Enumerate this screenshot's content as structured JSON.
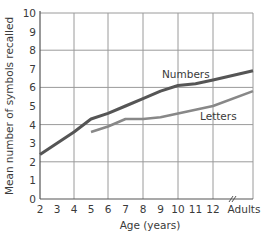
{
  "chart_data": {
    "type": "line",
    "title": "",
    "xlabel": "Age (years)",
    "ylabel": "Mean number of symbols recalled",
    "x_tick_labels": [
      "2",
      "3",
      "4",
      "5",
      "6",
      "7",
      "8",
      "9",
      "10",
      "11",
      "12",
      "Adults"
    ],
    "y_tick_labels": [
      "0",
      "1",
      "2",
      "3",
      "4",
      "5",
      "6",
      "7",
      "8",
      "9",
      "10"
    ],
    "ylim": [
      0,
      10
    ],
    "grid": true,
    "axis_break": "between 12 and Adults",
    "series": [
      {
        "name": "Numbers",
        "color": "#555555",
        "x": [
          "2",
          "3",
          "4",
          "5",
          "6",
          "7",
          "8",
          "9",
          "10",
          "11",
          "12",
          "Adults"
        ],
        "values": [
          2.4,
          3.0,
          3.6,
          4.3,
          4.6,
          5.0,
          5.4,
          5.8,
          6.1,
          6.2,
          6.4,
          6.9
        ]
      },
      {
        "name": "Letters",
        "color": "#888888",
        "x": [
          "5",
          "6",
          "7",
          "8",
          "9",
          "10",
          "11",
          "12",
          "Adults"
        ],
        "values": [
          3.6,
          3.9,
          4.3,
          4.3,
          4.4,
          4.6,
          4.8,
          5.0,
          5.8
        ]
      }
    ],
    "legend": "inline labels near lines"
  }
}
